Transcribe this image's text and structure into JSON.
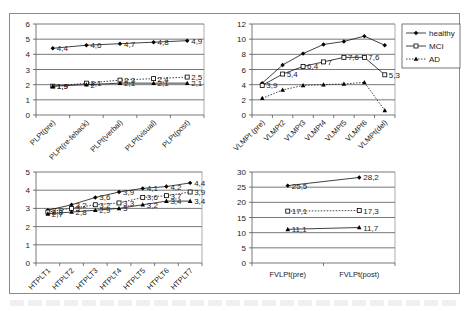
{
  "legend": {
    "items": [
      {
        "label": "healthy",
        "marker": "diamond-filled",
        "line": "solid",
        "color": "#000000"
      },
      {
        "label": "MCI",
        "marker": "square-open",
        "line": "solid",
        "color": "#000000"
      },
      {
        "label": "AD",
        "marker": "triangle-filled",
        "line": "dotted",
        "color": "#000000"
      }
    ]
  },
  "chart_data": [
    {
      "type": "line",
      "title": "",
      "xlabel": "",
      "ylabel": "",
      "ylim": [
        0,
        6
      ],
      "yticks": [
        0,
        1,
        2,
        3,
        4,
        5,
        6
      ],
      "grid": true,
      "categories": [
        "PLPt(pre)",
        "PLPt(re-feback)",
        "PLPt(verbal)",
        "PLPt(visual)",
        "PLPt(post)"
      ],
      "series": [
        {
          "name": "healthy",
          "values": [
            4.4,
            4.6,
            4.7,
            4.8,
            4.9
          ],
          "labels": [
            "4,4",
            "4,6",
            "4,7",
            "4,8",
            "4,9"
          ]
        },
        {
          "name": "MCI",
          "values": [
            1.9,
            2.1,
            2.3,
            2.4,
            2.5
          ],
          "labels": [
            "1,9",
            "2,1",
            "2,3",
            "2,4",
            "2,5"
          ]
        },
        {
          "name": "AD",
          "values": [
            1.9,
            2.0,
            2.1,
            2.1,
            2.1
          ],
          "labels": [
            "1,9",
            "2",
            "2,1",
            "2,1",
            "2,1"
          ]
        }
      ]
    },
    {
      "type": "line",
      "title": "",
      "xlabel": "",
      "ylabel": "",
      "ylim": [
        0,
        12
      ],
      "yticks": [
        0,
        2,
        4,
        6,
        8,
        10,
        12
      ],
      "grid": true,
      "legend_position": "right",
      "categories": [
        "VLMPt (pre)",
        "VLMPt2",
        "VLMPt3",
        "VLMPt4",
        "VLMPt5",
        "VLMPt6",
        "VLMPt(del)"
      ],
      "series": [
        {
          "name": "healthy",
          "values": [
            4.2,
            6.6,
            8.1,
            9.3,
            9.7,
            10.4,
            9.2
          ],
          "labels": []
        },
        {
          "name": "MCI",
          "values": [
            3.9,
            5.4,
            6.4,
            7.0,
            7.6,
            7.6,
            5.3
          ],
          "labels": [
            "3,9",
            "5,4",
            "6,4",
            "7",
            "7,6",
            "7,6",
            "5,3"
          ]
        },
        {
          "name": "AD",
          "values": [
            2.2,
            3.3,
            3.9,
            4.0,
            4.1,
            4.3,
            0.6
          ],
          "labels": []
        }
      ]
    },
    {
      "type": "line",
      "title": "",
      "xlabel": "",
      "ylabel": "",
      "ylim": [
        0,
        5
      ],
      "yticks": [
        0,
        1,
        2,
        3,
        4,
        5
      ],
      "grid": true,
      "categories": [
        "HTPLT1",
        "HTPLT2",
        "HTPLT3",
        "HTPLT4",
        "HTPLT5",
        "HTPLT6",
        "HTPLT7"
      ],
      "series": [
        {
          "name": "healthy",
          "values": [
            2.9,
            3.2,
            3.6,
            3.9,
            4.1,
            4.2,
            4.4
          ],
          "labels": [
            "2,9",
            "3,2",
            "3,6",
            "3,9",
            "4,1",
            "4,2",
            "4,4"
          ]
        },
        {
          "name": "MCI",
          "values": [
            2.8,
            3.0,
            3.2,
            3.3,
            3.6,
            3.7,
            3.9
          ],
          "labels": [
            "2,8",
            "3",
            "3,2",
            "3,3",
            "3,6",
            "3,7",
            "3,9"
          ]
        },
        {
          "name": "AD",
          "values": [
            2.7,
            2.8,
            2.9,
            3.0,
            3.2,
            3.4,
            3.4
          ],
          "labels": [
            "2,7",
            "2,8",
            "2,9",
            "3",
            "3,2",
            "3,4",
            "3,4"
          ]
        }
      ]
    },
    {
      "type": "line",
      "title": "",
      "xlabel": "",
      "ylabel": "",
      "ylim": [
        0,
        30
      ],
      "yticks": [
        0,
        5,
        10,
        15,
        20,
        25,
        30
      ],
      "grid": true,
      "categories": [
        "FVLPt(pre)",
        "FVLPt(post)"
      ],
      "series": [
        {
          "name": "healthy",
          "values": [
            25.5,
            28.2
          ],
          "labels": [
            "25,5",
            "28,2"
          ]
        },
        {
          "name": "MCI",
          "values": [
            17.1,
            17.3
          ],
          "labels": [
            "17,1",
            "17,3"
          ]
        },
        {
          "name": "AD",
          "values": [
            11.1,
            11.7
          ],
          "labels": [
            "11,1",
            "11,7"
          ]
        }
      ]
    }
  ]
}
